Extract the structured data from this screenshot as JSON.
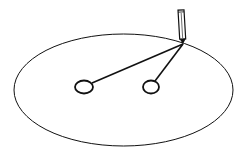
{
  "diagram": {
    "colors": {
      "background": "#ffffff",
      "stroke": "#111111"
    },
    "ellipse": {
      "cx": 123.5,
      "cy": 90,
      "rx": 109.5,
      "ry": 56
    },
    "pins": [
      {
        "name": "left-focus-pin",
        "cx": 84,
        "cy": 87,
        "rx": 9,
        "ry": 6.5
      },
      {
        "name": "right-focus-pin",
        "cx": 151,
        "cy": 87,
        "rx": 8,
        "ry": 6.5
      }
    ],
    "pencil": {
      "tip": [
        183,
        44
      ],
      "top": [
        181,
        10
      ],
      "width": 6
    },
    "strings": [
      {
        "from": [
          183,
          44
        ],
        "to": [
          92,
          83
        ]
      },
      {
        "from": [
          183,
          44
        ],
        "to": [
          155,
          81
        ]
      }
    ]
  }
}
